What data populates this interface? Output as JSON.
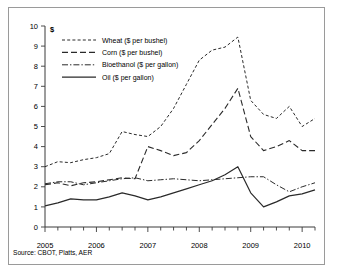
{
  "figure": {
    "unit_symbol": "$",
    "source_note": "Source: CBOT, Platts, AER"
  },
  "chart_data": {
    "type": "line",
    "title": "",
    "subtitle": "",
    "xlabel": "",
    "ylabel": "$",
    "ylim": [
      0,
      10
    ],
    "xlim": [
      2005,
      2010.25
    ],
    "grid": false,
    "legend_position": "top-left",
    "ytick_labels": [
      "0",
      "1",
      "2",
      "3",
      "4",
      "5",
      "6",
      "7",
      "8",
      "9",
      "10"
    ],
    "ytick_values": [
      0,
      1,
      2,
      3,
      4,
      5,
      6,
      7,
      8,
      9,
      10
    ],
    "xtick_labels": [
      "2005",
      "2006",
      "2007",
      "2008",
      "2009",
      "2010"
    ],
    "xtick_values": [
      2005,
      2006,
      2007,
      2008,
      2009,
      2010
    ],
    "minor_tick_interval": 0.25,
    "x": [
      2005.0,
      2005.25,
      2005.5,
      2005.75,
      2006.0,
      2006.25,
      2006.5,
      2006.75,
      2007.0,
      2007.25,
      2007.5,
      2007.75,
      2008.0,
      2008.25,
      2008.5,
      2008.75,
      2009.0,
      2009.25,
      2009.5,
      2009.75,
      2010.0,
      2010.25
    ],
    "series": [
      {
        "name": "Wheat ($ per bushel)",
        "line_style": "dashed",
        "color": "#2a2a2a",
        "values": [
          3.0,
          3.25,
          3.2,
          3.35,
          3.45,
          3.65,
          4.75,
          4.6,
          4.5,
          5.0,
          5.9,
          7.1,
          8.3,
          8.8,
          8.95,
          9.45,
          6.3,
          5.6,
          5.4,
          6.0,
          5.0,
          5.4
        ]
      },
      {
        "name": "Corn ($ per bushel)",
        "line_style": "long-dashed",
        "color": "#2a2a2a",
        "values": [
          2.1,
          2.2,
          2.05,
          2.2,
          2.25,
          2.35,
          2.45,
          2.4,
          4.0,
          3.8,
          3.55,
          3.7,
          4.3,
          5.1,
          5.9,
          6.9,
          4.5,
          3.8,
          4.0,
          4.3,
          3.8,
          3.8
        ]
      },
      {
        "name": "Bioethanol ($ per gallon)",
        "line_style": "dash-dot",
        "color": "#2a2a2a",
        "values": [
          2.15,
          2.25,
          2.25,
          2.1,
          2.2,
          2.3,
          2.4,
          2.45,
          2.3,
          2.35,
          2.4,
          2.35,
          2.3,
          2.35,
          2.4,
          2.45,
          2.5,
          2.5,
          2.1,
          1.75,
          2.0,
          2.2
        ]
      },
      {
        "name": "Oil ($ per gallon)",
        "line_style": "solid",
        "color": "#2a2a2a",
        "values": [
          1.05,
          1.2,
          1.4,
          1.35,
          1.35,
          1.5,
          1.7,
          1.55,
          1.35,
          1.5,
          1.7,
          1.9,
          2.1,
          2.3,
          2.6,
          3.0,
          1.7,
          1.0,
          1.25,
          1.55,
          1.65,
          1.85
        ]
      }
    ]
  },
  "legend": {
    "items": [
      {
        "label": "Wheat ($ per bushel)",
        "style": "dashed"
      },
      {
        "label": "Corn ($ per bushel)",
        "style": "long-dashed"
      },
      {
        "label": "Bioethanol ($ per gallon)",
        "style": "dash-dot"
      },
      {
        "label": "Oil ($ per gallon)",
        "style": "solid"
      }
    ]
  }
}
